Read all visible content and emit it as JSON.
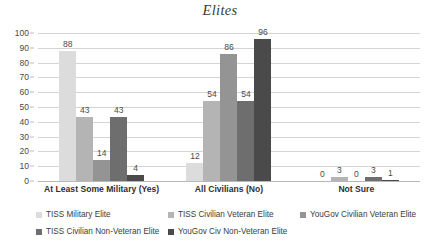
{
  "chart_data": {
    "type": "bar",
    "title": "Elites",
    "xlabel": "",
    "ylabel": "",
    "ylim": [
      0,
      100
    ],
    "ytick_step": 10,
    "yticks": [
      100,
      90,
      80,
      70,
      60,
      50,
      40,
      30,
      20,
      10,
      0
    ],
    "grid": true,
    "legend_position": "bottom",
    "categories": [
      "At Least Some Military (Yes)",
      "All Civilians (No)",
      "Not Sure"
    ],
    "series": [
      {
        "name": "TISS Military Elite",
        "color": "#dcdcdc",
        "values": [
          88,
          12,
          0
        ]
      },
      {
        "name": "TISS Civilian Veteran Elite",
        "color": "#b4b4b4",
        "values": [
          43,
          54,
          3
        ]
      },
      {
        "name": "YouGov Civilian Veteran Elite",
        "color": "#949494",
        "values": [
          14,
          86,
          0
        ]
      },
      {
        "name": "TISS Civilian Non-Veteran Elite",
        "color": "#6e6e6e",
        "values": [
          43,
          54,
          3
        ]
      },
      {
        "name": "YouGov Civ Non-Veteran Elite",
        "color": "#4a4a4a",
        "values": [
          4,
          96,
          1
        ]
      }
    ],
    "legend_order": [
      "TISS Military Elite",
      "TISS Civilian Veteran Elite",
      "YouGov Civilian Veteran Elite",
      "TISS Civilian Non-Veteran Elite",
      "YouGov Civ Non-Veteran Elite"
    ]
  }
}
